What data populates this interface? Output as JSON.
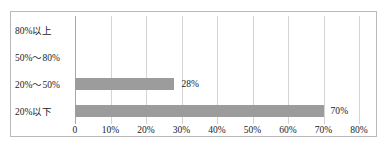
{
  "chart_data": {
    "type": "bar",
    "orientation": "horizontal",
    "title": "",
    "xlabel": "",
    "ylabel": "",
    "categories": [
      "80%以上",
      "50%～80%",
      "20%～50%",
      "20%以下"
    ],
    "values": [
      0,
      0,
      28,
      70
    ],
    "value_labels": [
      "",
      "",
      "28%",
      "70%"
    ],
    "xlim": [
      0,
      80
    ],
    "xticks": [
      0,
      10,
      20,
      30,
      40,
      50,
      60,
      70,
      80
    ],
    "xtick_labels": [
      "0",
      "10%",
      "20%",
      "30%",
      "40%",
      "50%",
      "60%",
      "70%",
      "80%"
    ],
    "grid": true,
    "grid_axis": "x",
    "legend": false,
    "legend_position": "none",
    "colors": {
      "bar_fill": "#9c9c9c",
      "gridline": "#d4d4d4",
      "axis_line": "#a8a8a8",
      "frame_border": "#b9b9b9",
      "background": "#ffffff",
      "text": "#20201f"
    }
  }
}
